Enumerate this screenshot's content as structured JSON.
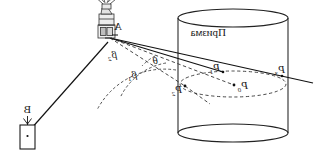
{
  "figure": {
    "caption_text": "Призма",
    "labels": {
      "instrument_point": "A",
      "target_point": "B",
      "angle_theta": "θ",
      "angle_beta_1": "β",
      "angle_beta_1_sub": "1",
      "angle_beta_2": "β",
      "angle_beta_2_sub": "2",
      "point_p0": "P",
      "point_p0_sub": "0",
      "point_p1": "P",
      "point_p1_sub": "1",
      "point_p2": "P",
      "point_p2_sub": "2",
      "point_p3": "P",
      "point_p3_sub": "3"
    },
    "colors": {
      "ink": "#1a1a1a",
      "stroke": "#222222",
      "dashed": "#333333",
      "background": "#ffffff"
    },
    "objects": {
      "cylinder_name": "prism-tower-cylinder",
      "instrument_name": "theodolite",
      "target_name": "target-prism-box"
    }
  }
}
